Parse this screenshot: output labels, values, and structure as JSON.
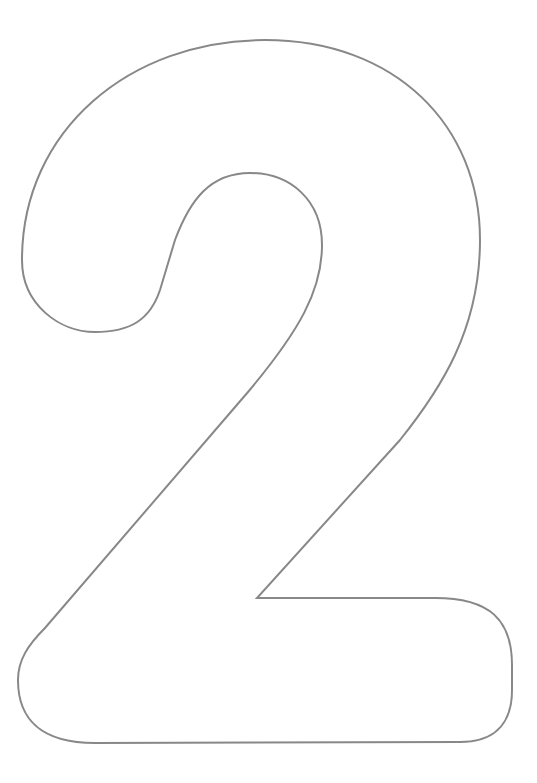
{
  "figure": {
    "glyph": "2",
    "style": "outline",
    "stroke_color": "#888888",
    "background_color": "#ffffff",
    "icon": "numeral-two-outline-icon"
  }
}
